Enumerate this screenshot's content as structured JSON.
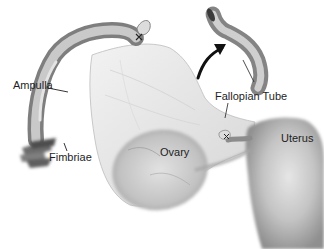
{
  "diagram": {
    "type": "anatomical-illustration",
    "style": "grayscale",
    "labels": {
      "ampulla": "Ampulla",
      "fimbriae": "Fimbriae",
      "ovary": "Ovary",
      "fallopian_tube": "Fallopian Tube",
      "uterus": "Uterus"
    },
    "colors": {
      "background": "#ffffff",
      "tissue_light": "#e4e4e4",
      "tissue_mid": "#b4b4b4",
      "tissue_dark": "#6e6e6e",
      "text": "#1e1e1e",
      "arrow": "#111111"
    }
  }
}
